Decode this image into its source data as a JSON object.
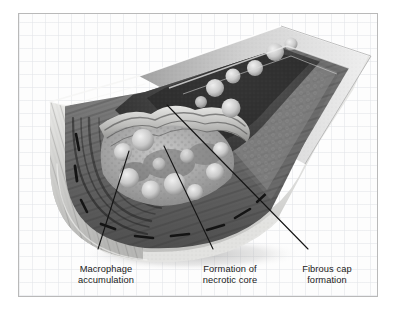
{
  "figure": {
    "style": "grayscale halftone medical illustration on faint grid paper",
    "frame": {
      "border_color": "#b9b9b9",
      "background_color": "#fdfdfd",
      "grid_color": "#e2e4e8"
    },
    "palette": {
      "ink": "#1a1a1a",
      "lumen_dark": "#3a3a3a",
      "media_mid": "#7d7d7d",
      "intima_light": "#cfcfcf",
      "adventitia_pale": "#e8e8e6",
      "foam_cell": "#d9d9d9",
      "shadow": "#9a9a9a"
    }
  },
  "labels": [
    {
      "id": "macrophage-accumulation",
      "line1": "Macrophage",
      "line2": "accumulation",
      "leader": {
        "x1": 97,
        "y1": 248,
        "x2": 128,
        "y2": 150
      }
    },
    {
      "id": "necrotic-core",
      "line1": "Formation of",
      "line2": "necrotic core",
      "leader": {
        "x1": 212,
        "y1": 248,
        "x2": 163,
        "y2": 145
      }
    },
    {
      "id": "fibrous-cap",
      "line1": "Fibrous cap",
      "line2": "formation",
      "leader": {
        "x1": 307,
        "y1": 248,
        "x2": 166,
        "y2": 104
      }
    }
  ],
  "structures": [
    {
      "name": "vessel-wall-cut-face",
      "description": "left semicircular cut end of artery showing concentric layers"
    },
    {
      "name": "fibrous-cap",
      "description": "pale wavy band capping the plaque"
    },
    {
      "name": "necrotic-core",
      "description": "mottled light core beneath fibrous cap"
    },
    {
      "name": "foam-cells",
      "description": "round pale macrophage-derived foam cells in intima and lumen"
    },
    {
      "name": "lumen",
      "description": "dark channel running diagonally to the upper right"
    },
    {
      "name": "adventitia",
      "description": "pale outer rim of the vessel"
    },
    {
      "name": "drop-shadow",
      "description": "soft gray shadow beneath the vessel"
    }
  ]
}
